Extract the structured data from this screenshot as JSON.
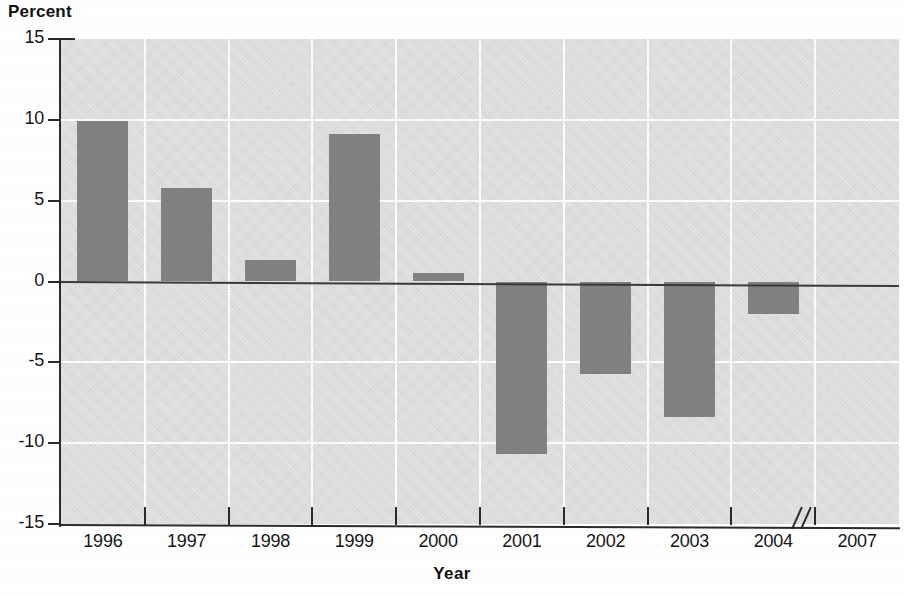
{
  "chart_data": {
    "type": "bar",
    "title": "",
    "ylabel": "Percent",
    "xlabel": "Year",
    "categories": [
      "1996",
      "1997",
      "1998",
      "1999",
      "2000",
      "2001",
      "2002",
      "2003",
      "2004",
      "2007"
    ],
    "values": [
      9.9,
      5.8,
      1.3,
      9.1,
      0.55,
      -10.7,
      -5.7,
      -8.4,
      -2.0,
      null
    ],
    "ylim": [
      -15,
      15
    ],
    "yticks": [
      15,
      10,
      5,
      0,
      -5,
      -10,
      -15
    ],
    "ytick_labels": [
      "15",
      "10",
      "5",
      "0",
      "-5",
      "-10",
      "-15"
    ],
    "grid": true,
    "legend": "none",
    "axis_break": {
      "present": true,
      "symbol": "//",
      "between": [
        "2004",
        "2007"
      ]
    },
    "annotations": [],
    "colors": {
      "bar_fill": "#818181",
      "plot_background": "#dcdcdc",
      "gridline": "#ffffff",
      "axis": "#2b2b2b",
      "text": "#171717",
      "page_background": "#ffffff"
    }
  },
  "axis": {
    "y_title": "Percent",
    "x_title": "Year"
  }
}
